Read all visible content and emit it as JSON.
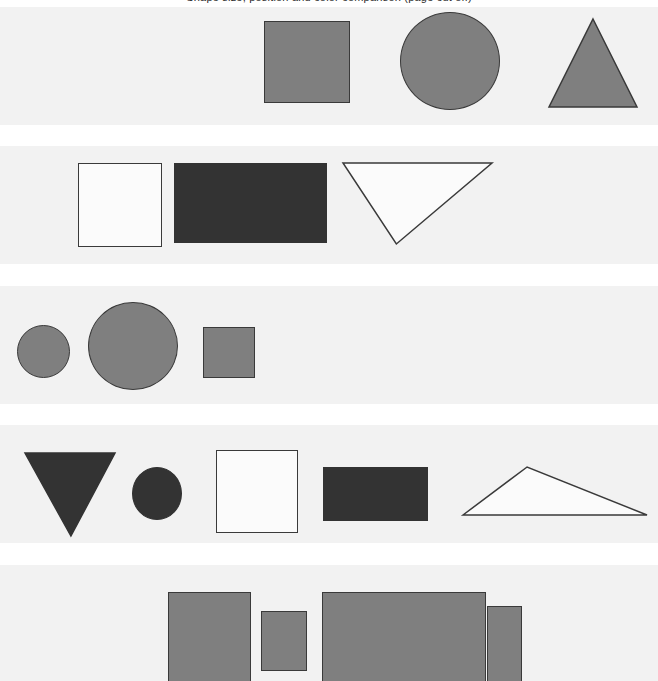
{
  "figure": {
    "title_clipped": "Shape size, position and color comparison (page cut off)",
    "background_color": "#ffffff",
    "band_color": "#f2f2f2",
    "width": 658,
    "height": 681,
    "palette": {
      "gray_fill": "#7f7f7f",
      "dark_fill": "#333333",
      "white_fill": "#fbfbfb",
      "stroke_dark": "#3a3a3a",
      "stroke_gray": "#4a4a4a"
    }
  },
  "rows": [
    {
      "name": "row-1",
      "band": {
        "x": 0,
        "y": 7,
        "w": 658,
        "h": 118
      },
      "shapes": [
        {
          "kind": "square",
          "fill": "#7f7f7f",
          "stroke": "#3a3a3a",
          "x": 264,
          "y": 21,
          "w": 86,
          "h": 82
        },
        {
          "kind": "circle",
          "fill": "#7f7f7f",
          "stroke": "#3a3a3a",
          "x": 400,
          "y": 12,
          "w": 100,
          "h": 98
        },
        {
          "kind": "triangle-up",
          "fill": "#7f7f7f",
          "stroke": "#3a3a3a",
          "x": 548,
          "y": 18,
          "w": 90,
          "h": 90
        }
      ]
    },
    {
      "name": "row-2",
      "band": {
        "x": 0,
        "y": 146,
        "w": 658,
        "h": 118
      },
      "shapes": [
        {
          "kind": "square",
          "fill": "#fbfbfb",
          "stroke": "#3a3a3a",
          "x": 78,
          "y": 163,
          "w": 84,
          "h": 84
        },
        {
          "kind": "rectangle",
          "fill": "#333333",
          "stroke": "#333333",
          "x": 174,
          "y": 163,
          "w": 153,
          "h": 80
        },
        {
          "kind": "triangle-down",
          "fill": "#fbfbfb",
          "stroke": "#3a3a3a",
          "x": 342,
          "y": 162,
          "w": 151,
          "h": 83,
          "apex_ratio": 0.36
        }
      ]
    },
    {
      "name": "row-3",
      "band": {
        "x": 0,
        "y": 286,
        "w": 658,
        "h": 118
      },
      "shapes": [
        {
          "kind": "circle",
          "fill": "#7f7f7f",
          "stroke": "#3a3a3a",
          "x": 17,
          "y": 325,
          "w": 53,
          "h": 53
        },
        {
          "kind": "circle",
          "fill": "#7f7f7f",
          "stroke": "#3a3a3a",
          "x": 88,
          "y": 302,
          "w": 90,
          "h": 88
        },
        {
          "kind": "square",
          "fill": "#7f7f7f",
          "stroke": "#3a3a3a",
          "x": 203,
          "y": 327,
          "w": 52,
          "h": 51
        }
      ]
    },
    {
      "name": "row-4",
      "band": {
        "x": 0,
        "y": 425,
        "w": 658,
        "h": 118
      },
      "shapes": [
        {
          "kind": "triangle-down",
          "fill": "#333333",
          "stroke": "#333333",
          "x": 24,
          "y": 452,
          "w": 92,
          "h": 85,
          "apex_ratio": 0.51
        },
        {
          "kind": "circle",
          "fill": "#333333",
          "stroke": "#333333",
          "x": 132,
          "y": 467,
          "w": 50,
          "h": 53
        },
        {
          "kind": "square",
          "fill": "#fbfbfb",
          "stroke": "#3a3a3a",
          "x": 216,
          "y": 450,
          "w": 82,
          "h": 83
        },
        {
          "kind": "rectangle",
          "fill": "#333333",
          "stroke": "#333333",
          "x": 323,
          "y": 467,
          "w": 105,
          "h": 54
        },
        {
          "kind": "triangle-obtuse",
          "fill": "#fbfbfb",
          "stroke": "#3a3a3a",
          "x": 462,
          "y": 466,
          "w": 186,
          "h": 50,
          "apex_ratio": 0.35
        }
      ]
    },
    {
      "name": "row-5",
      "band": {
        "x": 0,
        "y": 565,
        "w": 658,
        "h": 116
      },
      "shapes": [
        {
          "kind": "rectangle",
          "fill": "#7f7f7f",
          "stroke": "#3a3a3a",
          "x": 168,
          "y": 592,
          "w": 83,
          "h": 103
        },
        {
          "kind": "rectangle",
          "fill": "#7f7f7f",
          "stroke": "#3a3a3a",
          "x": 261,
          "y": 611,
          "w": 46,
          "h": 60
        },
        {
          "kind": "rectangle",
          "fill": "#7f7f7f",
          "stroke": "#3a3a3a",
          "x": 322,
          "y": 592,
          "w": 164,
          "h": 103
        },
        {
          "kind": "rectangle",
          "fill": "#7f7f7f",
          "stroke": "#3a3a3a",
          "x": 487,
          "y": 606,
          "w": 35,
          "h": 76
        }
      ]
    }
  ]
}
